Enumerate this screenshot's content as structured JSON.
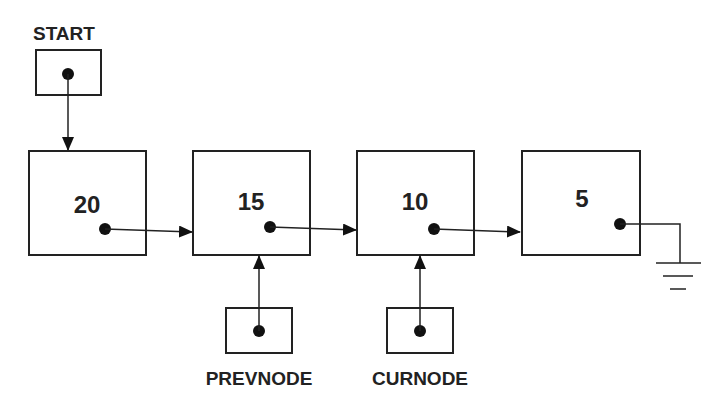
{
  "diagram": {
    "type": "singly-linked-list",
    "pointers": {
      "start": {
        "label": "START"
      },
      "prevnode": {
        "label": "PREVNODE"
      },
      "curnode": {
        "label": "CURNODE"
      }
    },
    "nodes": [
      {
        "value": "20"
      },
      {
        "value": "15"
      },
      {
        "value": "10"
      },
      {
        "value": "5"
      }
    ],
    "terminator": "null-ground-symbol",
    "colors": {
      "line": "#222222",
      "background": "#ffffff"
    }
  }
}
